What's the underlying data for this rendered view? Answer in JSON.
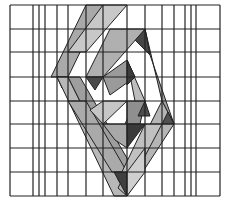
{
  "figure": {
    "width": 228,
    "height": 204,
    "background": "#ffffff",
    "grid": {
      "stroke": "#222222",
      "x_lines": [
        10,
        33,
        39,
        45,
        57,
        68,
        86,
        103,
        127,
        145,
        162,
        174,
        185,
        191,
        196,
        220
      ],
      "y_lines": [
        5,
        29,
        52,
        77,
        101,
        124,
        148,
        172,
        196
      ],
      "x_min": 10,
      "x_max": 220,
      "y_min": 5,
      "y_max": 196
    },
    "shapes": [
      {
        "name": "outer-strip-top-left",
        "fill": "#a9a9a9",
        "points": "86,5 103,5 68,77 51,77"
      },
      {
        "name": "outer-strip-top-right",
        "fill": "#c8c8c8",
        "points": "103,5 127,5 86,52 68,52"
      },
      {
        "name": "outer-left-vertex",
        "fill": "#555555",
        "points": "57,77 68,77 62,88"
      },
      {
        "name": "outer-strip-bottom-left",
        "fill": "#b8b8b8",
        "points": "57,77 68,77 127,196 114,196"
      },
      {
        "name": "outer-strip-bottom-left-inner",
        "fill": "#9e9e9e",
        "points": "68,77 80,77 135,172 127,196"
      },
      {
        "name": "outer-strip-right-upper",
        "fill": "#a0a0a0",
        "points": "145,29 162,101 174,124 150,55"
      },
      {
        "name": "outer-right-vertex-dark",
        "fill": "#454545",
        "points": "145,29 150,55 135,40"
      },
      {
        "name": "outer-strip-right-lower",
        "fill": "#b5b5b5",
        "points": "162,101 174,124 127,196 118,188"
      },
      {
        "name": "outer-right-small-dark",
        "fill": "#505050",
        "points": "174,124 168,112 162,124"
      },
      {
        "name": "second-strip-top",
        "fill": "#b0b0b0",
        "points": "110,29 145,29 103,77 86,77"
      },
      {
        "name": "second-strip-left-dark",
        "fill": "#4a4a4a",
        "points": "86,77 103,77 95,90"
      },
      {
        "name": "second-strip-left-lower",
        "fill": "#aaaaaa",
        "points": "68,101 86,101 127,172 112,172"
      },
      {
        "name": "second-strip-right",
        "fill": "#bdbdbd",
        "points": "127,60 145,101 127,148 118,140 135,101"
      },
      {
        "name": "third-strip-top",
        "fill": "#9a9a9a",
        "points": "103,77 127,60 135,77 110,95"
      },
      {
        "name": "third-strip-dark",
        "fill": "#3c3c3c",
        "points": "127,60 135,77 127,85"
      },
      {
        "name": "center-left",
        "fill": "#c6c6c6",
        "points": "103,101 127,101 103,124 90,110"
      },
      {
        "name": "center-right",
        "fill": "#8f8f8f",
        "points": "127,101 145,101 140,124 127,124"
      },
      {
        "name": "center-bottom-dark",
        "fill": "#3a3a3a",
        "points": "127,124 145,124 127,148"
      },
      {
        "name": "center-bottom-left",
        "fill": "#a8a8a8",
        "points": "103,124 127,124 127,148 115,140"
      },
      {
        "name": "center-right-dark",
        "fill": "#4d4d4d",
        "points": "145,101 150,116 138,116"
      },
      {
        "name": "lower-strip-right",
        "fill": "#c0c0c0",
        "points": "145,124 162,124 127,190 118,180"
      },
      {
        "name": "bottom-dark",
        "fill": "#3f3f3f",
        "points": "114,172 127,172 127,196"
      },
      {
        "name": "bottom-right-light",
        "fill": "#cfcfcf",
        "points": "127,172 145,148 145,172 127,196"
      }
    ]
  }
}
